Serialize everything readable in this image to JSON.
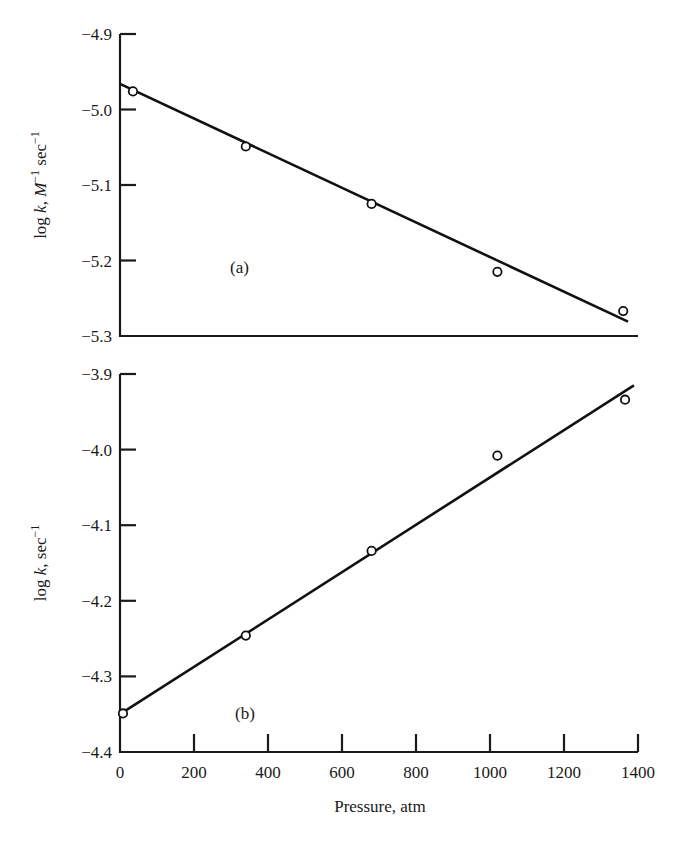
{
  "chart_data": [
    {
      "type": "scatter",
      "panel": "(a)",
      "title": "",
      "xlabel": "Pressure, atm",
      "ylabel": "log k, M⁻¹ sec⁻¹",
      "ylabel_parts": {
        "main": "log ",
        "italic_k": "k",
        "comma": ", ",
        "italic_M": "M",
        "sup1": "−1",
        "sec": " sec",
        "sup2": "−1"
      },
      "xlim": [
        0,
        1400
      ],
      "ylim": [
        -5.3,
        -4.9
      ],
      "yticks": [
        -4.9,
        -5.0,
        -5.1,
        -5.2,
        -5.3
      ],
      "ytick_labels": [
        "−4.9",
        "−5.0",
        "−5.1",
        "−5.2",
        "−5.3"
      ],
      "grid": false,
      "series": [
        {
          "name": "data",
          "marker": "open-circle",
          "x": [
            35,
            340,
            680,
            1020,
            1360
          ],
          "y": [
            -4.976,
            -5.049,
            -5.125,
            -5.215,
            -5.267
          ]
        },
        {
          "name": "fit",
          "style": "line",
          "x": [
            0,
            1373
          ],
          "y": [
            -4.966,
            -5.281
          ]
        }
      ]
    },
    {
      "type": "scatter",
      "panel": "(b)",
      "title": "",
      "xlabel": "Pressure, atm",
      "ylabel": "log k, sec⁻¹",
      "ylabel_parts": {
        "main": "log ",
        "italic_k": "k",
        "comma": ", sec",
        "sup": "−1"
      },
      "xlim": [
        0,
        1400
      ],
      "ylim": [
        -4.4,
        -3.9
      ],
      "yticks": [
        -3.9,
        -4.0,
        -4.1,
        -4.2,
        -4.3,
        -4.4
      ],
      "ytick_labels": [
        "−3.9",
        "−4.0",
        "−4.1",
        "−4.2",
        "−4.3",
        "−4.4"
      ],
      "xticks": [
        0,
        200,
        400,
        600,
        800,
        1000,
        1200,
        1400
      ],
      "xtick_labels": [
        "0",
        "200",
        "400",
        "600",
        "800",
        "1000",
        "1200",
        "1400"
      ],
      "grid": false,
      "series": [
        {
          "name": "data",
          "marker": "open-circle",
          "x": [
            8,
            340,
            680,
            1020,
            1365
          ],
          "y": [
            -4.349,
            -4.246,
            -4.134,
            -4.008,
            -3.934
          ]
        },
        {
          "name": "fit",
          "style": "line",
          "x": [
            0,
            1389
          ],
          "y": [
            -4.35,
            -3.915
          ]
        }
      ]
    }
  ],
  "labels": {
    "panel_a": "(a)",
    "panel_b": "(b)",
    "xlabel": "Pressure, atm",
    "ylabel_a": {
      "log": "log ",
      "k": "k",
      "sep": ", ",
      "M": "M",
      "sup1": "−1",
      "sec": " sec",
      "sup2": "−1"
    },
    "ylabel_b": {
      "log": "log ",
      "k": "k",
      "sep": ", sec",
      "sup": "−1"
    }
  }
}
